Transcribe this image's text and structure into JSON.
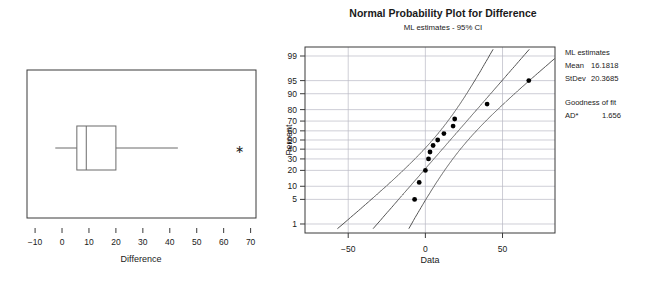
{
  "boxplot": {
    "name": "boxplot-difference",
    "axis_title": "Difference",
    "x_ticks": [
      -10,
      0,
      10,
      20,
      30,
      40,
      50,
      60,
      70
    ],
    "xlim": [
      -13,
      72
    ],
    "box": {
      "whisker_low": -2.5,
      "q1": 5.5,
      "median": 9.0,
      "q3": 20.0,
      "whisker_high": 43.0
    },
    "outliers": [
      66.0
    ]
  },
  "probplot": {
    "name": "normal-probability-plot",
    "title": "Normal Probability Plot for Difference",
    "subtitle": "ML estimates - 95% CI",
    "xlabel": "Data",
    "ylabel": "Percent",
    "x_ticks": [
      -50,
      0,
      50
    ],
    "xlim": [
      -78,
      84
    ],
    "y_ticks": [
      99,
      95,
      90,
      80,
      70,
      60,
      50,
      40,
      30,
      20,
      10,
      5,
      1
    ],
    "legend": {
      "heading": "ML estimates",
      "mean_label": "Mean",
      "mean_value": "16.1818",
      "stdev_label": "StDev",
      "stdev_value": "20.3685",
      "fit_heading": "Goodness of fit",
      "ad_label": "AD*",
      "ad_value": "1.656"
    }
  },
  "chart_data": {
    "type": "scatter",
    "title": "Normal Probability Plot for Difference",
    "subtitle": "ML estimates - 95% CI",
    "xlabel": "Data",
    "ylabel": "Percent",
    "xlim": [
      -78,
      84
    ],
    "x_ticks": [
      -50,
      0,
      50
    ],
    "y_percent_ticks": [
      99,
      95,
      90,
      80,
      70,
      60,
      50,
      40,
      30,
      20,
      10,
      5,
      1
    ],
    "grid": true,
    "legend_position": "right-outside",
    "series": [
      {
        "name": "Difference observations",
        "x": [
          -7.0,
          -4.0,
          0.0,
          2.0,
          3.0,
          5.0,
          8.0,
          12.0,
          18.0,
          19.0,
          40.0,
          67.0
        ],
        "percent": [
          5.0,
          12.0,
          20.0,
          30.0,
          37.0,
          44.0,
          50.0,
          57.0,
          65.0,
          72.0,
          84.0,
          95.0
        ]
      },
      {
        "name": "ML fit line",
        "type": "line",
        "description": "Straight ML normal fit through Mean 16.1818, StDev 20.3685"
      },
      {
        "name": "95% CI lower bound",
        "type": "curve"
      },
      {
        "name": "95% CI upper bound",
        "type": "curve"
      }
    ],
    "annotations": {
      "mean": 16.1818,
      "stdev": 20.3685,
      "ad_star": 1.656
    },
    "boxplot_panel": {
      "type": "box",
      "xlabel": "Difference",
      "x_ticks": [
        -10,
        0,
        10,
        20,
        30,
        40,
        50,
        60,
        70
      ],
      "whisker_low": -2.5,
      "q1": 5.5,
      "median": 9.0,
      "q3": 20.0,
      "whisker_high": 43.0,
      "outliers": [
        66.0
      ]
    }
  }
}
